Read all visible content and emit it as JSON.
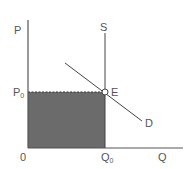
{
  "diagram": {
    "type": "supply-demand",
    "axes": {
      "y_label": "P",
      "x_label": "Q",
      "origin_label": "0"
    },
    "curves": {
      "supply_label": "S",
      "demand_label": "D"
    },
    "equilibrium": {
      "point_label": "E",
      "price_label": "P",
      "price_subscript": "0",
      "quantity_label": "Q",
      "quantity_subscript": "0"
    },
    "colors": {
      "axis": "#555555",
      "shaded_area": "#6b6b6b",
      "line": "#444444"
    }
  }
}
